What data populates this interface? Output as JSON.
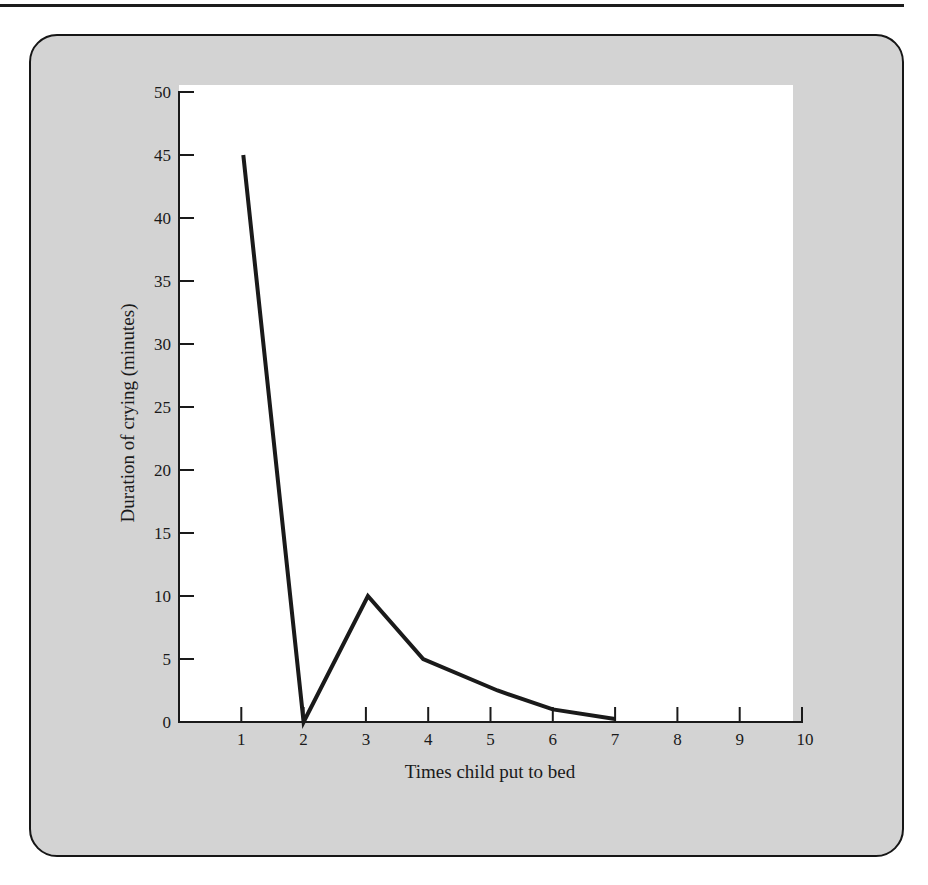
{
  "chart_data": {
    "type": "line",
    "title": "",
    "xlabel": "Times child put to bed",
    "ylabel": "Duration of crying (minutes)",
    "x": [
      1,
      2,
      3,
      4,
      5,
      6,
      7
    ],
    "series": [
      {
        "name": "Duration of crying",
        "values": [
          45,
          0,
          10,
          5,
          2.5,
          1,
          0.25
        ]
      }
    ],
    "xlim": [
      0,
      10
    ],
    "ylim": [
      0,
      50
    ],
    "x_ticks": [
      "1",
      "2",
      "3",
      "4",
      "5",
      "6",
      "7",
      "8",
      "9",
      "10"
    ],
    "y_ticks": [
      "0",
      "5",
      "10",
      "15",
      "20",
      "25",
      "30",
      "35",
      "40",
      "45",
      "50"
    ],
    "grid": false,
    "legend": "none"
  },
  "colors": {
    "frame_fill": "#d3d3d3",
    "frame_border": "#161616",
    "plot_fill": "#ffffff",
    "line": "#1a1a1a"
  },
  "axes": {
    "xlabel": "Times child put to bed",
    "ylabel": "Duration of crying (minutes)"
  }
}
